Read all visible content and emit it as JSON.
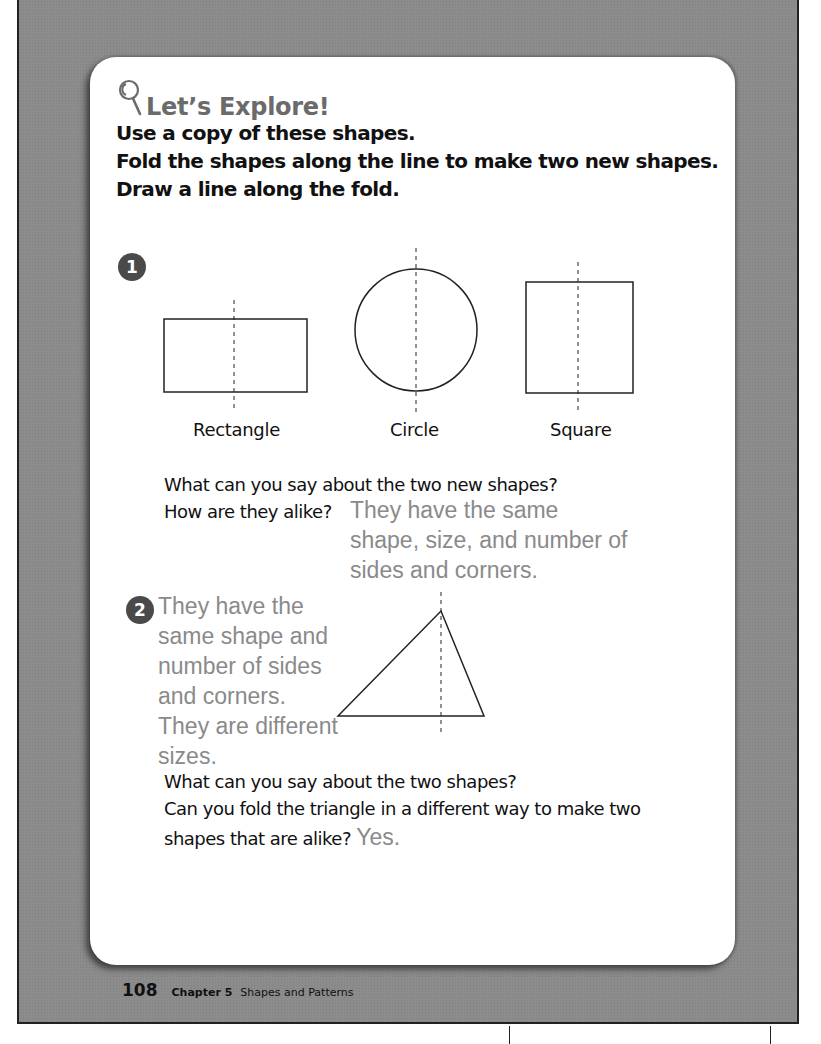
{
  "header": {
    "icon": "magnifying-glass-icon",
    "title": "Let’s Explore!"
  },
  "instructions": [
    "Use a copy of these shapes.",
    "Fold the shapes along the line to make two new shapes.",
    "Draw a line along the fold."
  ],
  "problem1": {
    "number": "1",
    "shapes": [
      {
        "name": "rectangle",
        "label": "Rectangle"
      },
      {
        "name": "circle",
        "label": "Circle"
      },
      {
        "name": "square",
        "label": "Square"
      }
    ],
    "question_line1": "What can you say about the two new shapes?",
    "question_line2": "How are they alike?",
    "answer_lines": [
      "They have the same",
      "shape, size, and number of",
      "sides and corners."
    ]
  },
  "problem2": {
    "number": "2",
    "shape": "triangle",
    "answer_lines": [
      "They have the",
      "same shape and",
      "number of sides",
      "and corners.",
      "They are different",
      "sizes."
    ],
    "question_line1": "What can you say about the two shapes?",
    "question_line2": "Can you fold the triangle in a different way to make two",
    "question_line3": "shapes that are alike?",
    "answer2": "Yes."
  },
  "footer": {
    "page_number": "108",
    "chapter": "Chapter 5",
    "chapter_title": "Shapes and Patterns"
  },
  "colors": {
    "frame": "#8c8c8c",
    "card": "#ffffff",
    "answer_text": "#8a8a8a",
    "badge": "#4a4a4a",
    "header_text": "#6b6b6b"
  }
}
